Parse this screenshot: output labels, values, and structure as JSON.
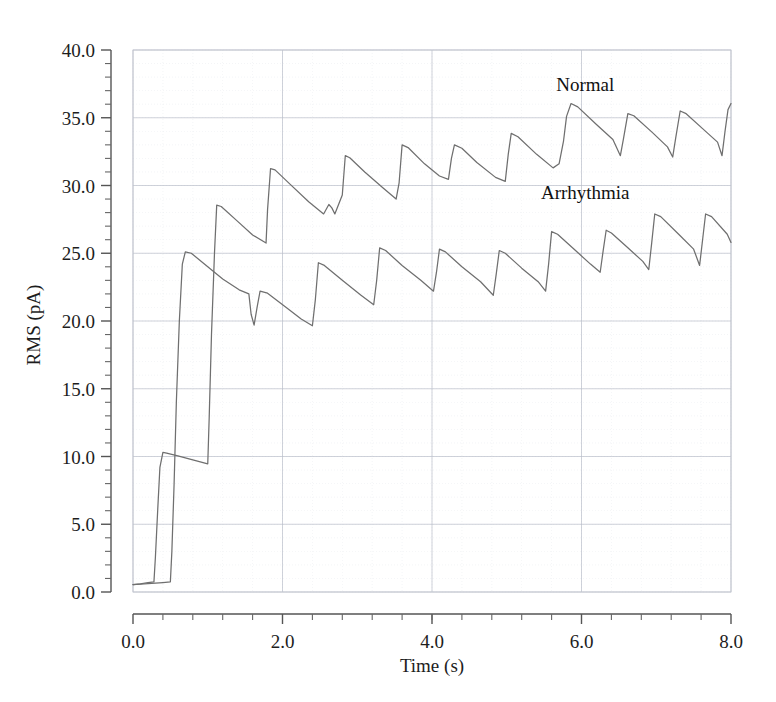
{
  "chart_data": {
    "type": "line",
    "title": "",
    "xlabel": "Time (s)",
    "ylabel": "RMS (pA)",
    "xlim": [
      0.0,
      8.0
    ],
    "ylim": [
      0.0,
      40.0
    ],
    "x_major_ticks": [
      0.0,
      2.0,
      4.0,
      6.0,
      8.0
    ],
    "x_tick_labels": [
      "0.0",
      "2.0",
      "4.0",
      "6.0",
      "8.0"
    ],
    "x_minor_step": 0.4,
    "y_major_ticks": [
      0.0,
      5.0,
      10.0,
      15.0,
      20.0,
      25.0,
      30.0,
      35.0,
      40.0
    ],
    "y_tick_labels": [
      "0.0",
      "5.0",
      "10.0",
      "15.0",
      "20.0",
      "25.0",
      "30.0",
      "35.0",
      "40.0"
    ],
    "y_minor_step": 1.0,
    "grid": true,
    "grid_color": "#d9dce4",
    "legend_position": "inside-annotations",
    "line_color": "#6f6f6f",
    "series": [
      {
        "name": "Normal",
        "annotation": "Normal",
        "annotation_x": 6.05,
        "annotation_y": 37.0,
        "points": [
          [
            0.0,
            0.55
          ],
          [
            0.1,
            0.6
          ],
          [
            0.2,
            0.7
          ],
          [
            0.28,
            0.75
          ],
          [
            0.3,
            2.6
          ],
          [
            0.33,
            6.0
          ],
          [
            0.36,
            9.2
          ],
          [
            0.4,
            10.3
          ],
          [
            0.45,
            10.25
          ],
          [
            0.6,
            10.05
          ],
          [
            0.8,
            9.75
          ],
          [
            1.0,
            9.45
          ],
          [
            1.02,
            13.0
          ],
          [
            1.05,
            19.0
          ],
          [
            1.09,
            25.0
          ],
          [
            1.12,
            28.55
          ],
          [
            1.18,
            28.45
          ],
          [
            1.4,
            27.35
          ],
          [
            1.6,
            26.35
          ],
          [
            1.78,
            25.75
          ],
          [
            1.8,
            28.2
          ],
          [
            1.84,
            31.25
          ],
          [
            1.9,
            31.15
          ],
          [
            2.1,
            30.1
          ],
          [
            2.35,
            28.8
          ],
          [
            2.55,
            27.9
          ],
          [
            2.62,
            28.6
          ],
          [
            2.66,
            28.35
          ],
          [
            2.7,
            27.9
          ],
          [
            2.8,
            29.3
          ],
          [
            2.84,
            32.2
          ],
          [
            2.9,
            32.05
          ],
          [
            3.1,
            31.0
          ],
          [
            3.35,
            29.8
          ],
          [
            3.52,
            29.0
          ],
          [
            3.56,
            30.2
          ],
          [
            3.6,
            33.0
          ],
          [
            3.68,
            32.8
          ],
          [
            3.9,
            31.6
          ],
          [
            4.1,
            30.7
          ],
          [
            4.22,
            30.45
          ],
          [
            4.26,
            32.0
          ],
          [
            4.3,
            33.0
          ],
          [
            4.4,
            32.75
          ],
          [
            4.6,
            31.7
          ],
          [
            4.85,
            30.6
          ],
          [
            4.98,
            30.3
          ],
          [
            5.02,
            32.3
          ],
          [
            5.06,
            33.85
          ],
          [
            5.15,
            33.6
          ],
          [
            5.4,
            32.3
          ],
          [
            5.62,
            31.3
          ],
          [
            5.7,
            31.6
          ],
          [
            5.76,
            33.3
          ],
          [
            5.8,
            35.1
          ],
          [
            5.86,
            36.05
          ],
          [
            5.95,
            35.8
          ],
          [
            6.2,
            34.5
          ],
          [
            6.42,
            33.4
          ],
          [
            6.52,
            32.2
          ],
          [
            6.56,
            33.4
          ],
          [
            6.62,
            35.3
          ],
          [
            6.7,
            35.15
          ],
          [
            6.95,
            33.9
          ],
          [
            7.15,
            32.85
          ],
          [
            7.22,
            32.1
          ],
          [
            7.26,
            33.5
          ],
          [
            7.32,
            35.5
          ],
          [
            7.4,
            35.3
          ],
          [
            7.62,
            34.2
          ],
          [
            7.82,
            33.2
          ],
          [
            7.88,
            32.2
          ],
          [
            7.92,
            34.0
          ],
          [
            7.96,
            35.6
          ],
          [
            8.0,
            36.05
          ]
        ]
      },
      {
        "name": "Arrhythmia",
        "annotation": "Arrhythmia",
        "annotation_x": 6.05,
        "annotation_y": 29.0,
        "points": [
          [
            0.0,
            0.55
          ],
          [
            0.2,
            0.62
          ],
          [
            0.4,
            0.7
          ],
          [
            0.5,
            0.75
          ],
          [
            0.52,
            3.0
          ],
          [
            0.55,
            8.0
          ],
          [
            0.58,
            14.0
          ],
          [
            0.62,
            20.0
          ],
          [
            0.66,
            24.2
          ],
          [
            0.7,
            25.1
          ],
          [
            0.78,
            25.0
          ],
          [
            1.0,
            24.0
          ],
          [
            1.2,
            23.1
          ],
          [
            1.42,
            22.3
          ],
          [
            1.55,
            22.0
          ],
          [
            1.58,
            20.5
          ],
          [
            1.62,
            19.7
          ],
          [
            1.66,
            21.0
          ],
          [
            1.7,
            22.2
          ],
          [
            1.8,
            22.05
          ],
          [
            2.05,
            21.0
          ],
          [
            2.25,
            20.15
          ],
          [
            2.4,
            19.65
          ],
          [
            2.44,
            21.6
          ],
          [
            2.48,
            24.3
          ],
          [
            2.56,
            24.1
          ],
          [
            2.8,
            23.0
          ],
          [
            3.05,
            21.9
          ],
          [
            3.22,
            21.2
          ],
          [
            3.26,
            23.0
          ],
          [
            3.3,
            25.4
          ],
          [
            3.38,
            25.2
          ],
          [
            3.6,
            24.1
          ],
          [
            3.85,
            23.0
          ],
          [
            4.02,
            22.2
          ],
          [
            4.06,
            23.6
          ],
          [
            4.1,
            25.3
          ],
          [
            4.18,
            25.1
          ],
          [
            4.4,
            24.0
          ],
          [
            4.65,
            22.9
          ],
          [
            4.82,
            21.9
          ],
          [
            4.86,
            23.5
          ],
          [
            4.9,
            25.2
          ],
          [
            4.98,
            25.0
          ],
          [
            5.2,
            23.9
          ],
          [
            5.42,
            22.9
          ],
          [
            5.52,
            22.2
          ],
          [
            5.56,
            24.2
          ],
          [
            5.6,
            26.6
          ],
          [
            5.68,
            26.4
          ],
          [
            5.92,
            25.2
          ],
          [
            6.12,
            24.2
          ],
          [
            6.25,
            23.6
          ],
          [
            6.29,
            25.2
          ],
          [
            6.33,
            26.7
          ],
          [
            6.4,
            26.5
          ],
          [
            6.62,
            25.4
          ],
          [
            6.82,
            24.4
          ],
          [
            6.9,
            23.8
          ],
          [
            6.94,
            25.8
          ],
          [
            6.98,
            27.9
          ],
          [
            7.06,
            27.7
          ],
          [
            7.3,
            26.4
          ],
          [
            7.5,
            25.3
          ],
          [
            7.58,
            24.1
          ],
          [
            7.62,
            26.0
          ],
          [
            7.66,
            27.9
          ],
          [
            7.74,
            27.7
          ],
          [
            7.95,
            26.4
          ],
          [
            8.0,
            25.8
          ]
        ]
      }
    ]
  }
}
